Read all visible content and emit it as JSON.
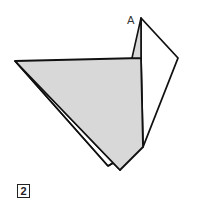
{
  "diagram": {
    "labels": {
      "point_a": "A"
    },
    "step_number": "2",
    "colors": {
      "paper_colored": "#d8d8d8",
      "paper_white": "#ffffff",
      "line": "#111111"
    }
  }
}
